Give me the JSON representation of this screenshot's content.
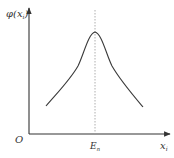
{
  "diagram": {
    "y_axis_label": "φ(x",
    "y_axis_label_sub": "i",
    "y_axis_label_close": ")",
    "origin_label": "O",
    "x_axis_label": "x",
    "x_axis_label_sub": "i",
    "peak_label": "E",
    "peak_label_sub": "n",
    "curve_shape": "symmetric peaked curve with maximum at E_n",
    "colors": {
      "axis": "#333333",
      "curve": "#3a3a3a",
      "dashed_line": "#999999",
      "text": "#333333"
    }
  }
}
